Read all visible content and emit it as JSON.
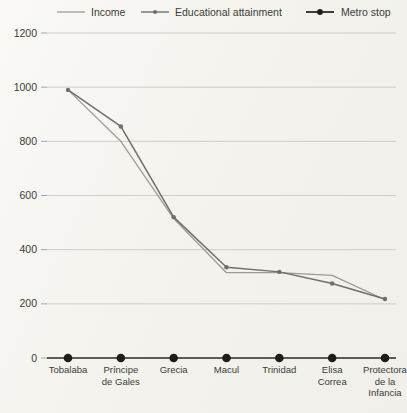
{
  "chart_data": {
    "type": "line",
    "title": "",
    "subtitle": "",
    "xlabel": "",
    "ylabel": "",
    "ylim": [
      0,
      1200
    ],
    "yticks": [
      0,
      200,
      400,
      600,
      800,
      1000,
      1200
    ],
    "grid": true,
    "legend_position": "top",
    "categories": [
      "Tobalaba",
      "Príncipe de Gales",
      "Grecia",
      "Macul",
      "Trinidad",
      "Elisa Correa",
      "Protectora de la Infancia"
    ],
    "category_lines": [
      [
        "Tobalaba"
      ],
      [
        "Príncipe",
        "de Gales"
      ],
      [
        "Grecia"
      ],
      [
        "Macul"
      ],
      [
        "Trinidad"
      ],
      [
        "Elisa",
        "Correa"
      ],
      [
        "Protectora",
        "de la",
        "Infancia"
      ]
    ],
    "series": [
      {
        "name": "Income",
        "color": "#9c9c96",
        "marker": "none",
        "values": [
          990,
          800,
          515,
          315,
          315,
          305,
          215
        ]
      },
      {
        "name": "Educational attainment",
        "color": "#6f6f6a",
        "marker": "circle",
        "values": [
          990,
          855,
          520,
          335,
          318,
          275,
          218
        ]
      },
      {
        "name": "Metro stop",
        "color": "#1d1d1b",
        "marker": "circle-large",
        "values": [
          0,
          0,
          0,
          0,
          0,
          0,
          0
        ]
      }
    ]
  },
  "legend": {
    "items": [
      {
        "label": "Income",
        "style": "line-plain",
        "color": "#9c9c96"
      },
      {
        "label": "Educational attainment",
        "style": "line-marker",
        "color": "#6f6f6a"
      },
      {
        "label": "Metro stop",
        "style": "line-marker-bold",
        "color": "#1d1d1b"
      }
    ]
  },
  "axis": {
    "y_tick_labels": [
      "1200",
      "1000",
      "800",
      "600",
      "400",
      "200",
      "0"
    ]
  }
}
